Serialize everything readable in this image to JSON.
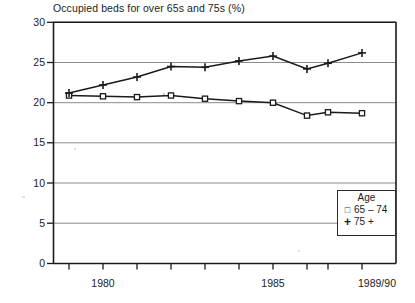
{
  "chart_data": {
    "type": "line",
    "title": "Occupied beds for over 65s and 75s (%)",
    "xlabel": "",
    "ylabel": "",
    "ylim": [
      0,
      30
    ],
    "yticks": [
      0,
      5,
      10,
      15,
      20,
      25,
      30
    ],
    "grid": true,
    "legend_position": "bottom-right",
    "legend_title": "Age",
    "x": [
      "1979/80",
      "1980",
      "1981",
      "1982",
      "1983",
      "1984",
      "1985",
      "1986",
      "1987",
      "1989/90"
    ],
    "xtick_labels": [
      "",
      "1980",
      "",
      "",
      "",
      "",
      "1985",
      "",
      "",
      "1989/90"
    ],
    "series": [
      {
        "name": "65 – 74",
        "marker": "square",
        "values": [
          20.9,
          20.8,
          20.7,
          20.9,
          20.5,
          20.2,
          20.0,
          18.4,
          18.8,
          18.7
        ]
      },
      {
        "name": "75 +",
        "marker": "plus",
        "values": [
          21.2,
          22.2,
          23.2,
          24.5,
          24.4,
          25.2,
          25.8,
          24.2,
          24.9,
          26.2
        ]
      }
    ]
  },
  "legend": {
    "title": "Age",
    "entries": [
      {
        "marker_icon": "square-marker-icon",
        "marker_glyph": "□",
        "label": "65 – 74"
      },
      {
        "marker_icon": "plus-marker-icon",
        "marker_glyph": "+",
        "label": "75 +"
      }
    ]
  },
  "axes": {
    "y_tick_labels": [
      "30",
      "25",
      "20",
      "15",
      "10",
      "5",
      "0"
    ],
    "x_tick_labels": [
      "1980",
      "1985",
      "1989/90"
    ]
  },
  "colors": {
    "line": "#1a1a1a",
    "grid": "#8c8c8c",
    "axis": "#1a1a1a",
    "text": "#1c1c1c",
    "background": "#ffffff"
  }
}
